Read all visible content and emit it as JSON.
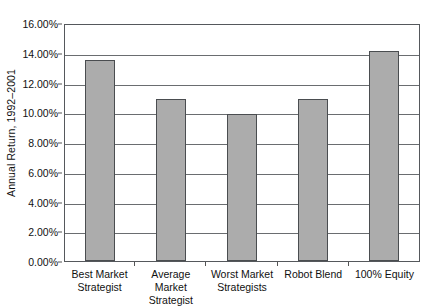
{
  "chart_data": {
    "type": "bar",
    "title": "",
    "xlabel": "",
    "ylabel": "Annual Return, 1992–2001",
    "ylim": [
      0,
      16
    ],
    "yticks": [
      0,
      2,
      4,
      6,
      8,
      10,
      12,
      14,
      16
    ],
    "ytick_labels": [
      "0.00%",
      "2.00%",
      "4.00%",
      "6.00%",
      "8.00%",
      "10.00%",
      "12.00%",
      "14.00%",
      "16.00%"
    ],
    "grid": "horizontal",
    "legend": "none",
    "units": "percent",
    "categories": [
      "Best Market Strategist",
      "Average Market Strategist",
      "Worst Market Strategists",
      "Robot Blend",
      "100% Equity"
    ],
    "category_lines": [
      [
        "Best Market",
        "Strategist"
      ],
      [
        "Average Market",
        "Strategist"
      ],
      [
        "Worst Market",
        "Strategists"
      ],
      [
        "Robot Blend",
        ""
      ],
      [
        "100% Equity",
        ""
      ]
    ],
    "values": [
      13.6,
      11.0,
      10.0,
      11.0,
      14.25
    ],
    "value_labels": [
      "13.60%",
      "11.00%",
      "10.00%",
      "11.00%",
      "14.25%"
    ],
    "colors": {
      "bar_fill": "#acacac",
      "bar_border": "#4a4d50",
      "gridline": "#6a6d70",
      "plot_border": "#55585c",
      "background": "#ffffff",
      "text": "#111111"
    }
  }
}
